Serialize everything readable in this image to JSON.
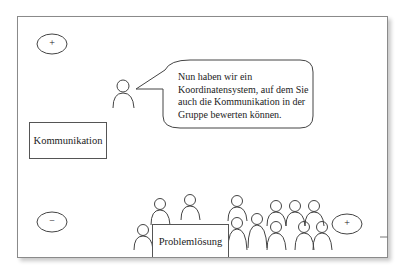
{
  "diagram": {
    "axis_labels": {
      "y_axis": "Kommunikation",
      "x_axis": "Problemlösung"
    },
    "markers": {
      "top_left": "+",
      "bottom_left": "−",
      "bottom_right": "+"
    },
    "speech_bubble": {
      "text": "Nun haben wir ein Koordinatensystem, auf dem Sie auch die Kommunikation in der Gruppe bewerten können."
    },
    "colors": {
      "stroke": "#444444",
      "frame": "#8a8a8a",
      "background": "#ffffff"
    }
  }
}
